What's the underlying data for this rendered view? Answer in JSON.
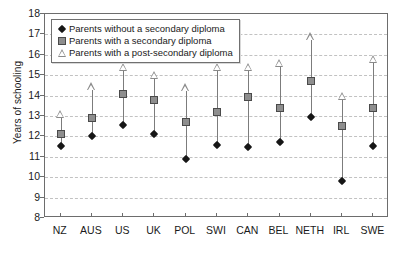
{
  "chart_data": {
    "type": "scatter",
    "title": "",
    "xlabel": "",
    "ylabel": "Years of schooling",
    "ylim": [
      8,
      18
    ],
    "yticks": [
      8,
      9,
      10,
      11,
      12,
      13,
      14,
      15,
      16,
      17,
      18
    ],
    "grid": true,
    "legend_position": "top-left",
    "categories": [
      "NZ",
      "AUS",
      "US",
      "UK",
      "POL",
      "SWI",
      "CAN",
      "BEL",
      "NETH",
      "IRL",
      "SWE"
    ],
    "series": [
      {
        "name": "Parents without a secondary diploma",
        "marker": "diamond",
        "color": "#161616",
        "values": [
          11.55,
          12.0,
          12.55,
          12.1,
          10.9,
          11.6,
          11.5,
          11.75,
          12.95,
          9.8,
          11.55
        ]
      },
      {
        "name": "Parents with a secondary diploma",
        "marker": "square",
        "color": "#8e8e8e",
        "values": [
          12.1,
          12.9,
          14.1,
          13.8,
          12.7,
          13.2,
          13.95,
          13.4,
          14.7,
          12.5,
          13.4
        ]
      },
      {
        "name": "Parents with a post-secondary diploma",
        "marker": "triangle",
        "color": "#8a8a8a",
        "values": [
          13.1,
          14.45,
          15.4,
          15.0,
          14.4,
          15.4,
          15.4,
          15.6,
          16.9,
          14.0,
          15.8
        ]
      }
    ]
  },
  "axes": {
    "y_title": "Years of schooling",
    "y_tick_labels": [
      "18",
      "17",
      "16",
      "15",
      "14",
      "13",
      "12",
      "11",
      "10",
      "9",
      "8"
    ],
    "x_tick_labels": [
      "NZ",
      "AUS",
      "US",
      "UK",
      "POL",
      "SWI",
      "CAN",
      "BEL",
      "NETH",
      "IRL",
      "SWE"
    ]
  },
  "legend": {
    "items": [
      {
        "label": "Parents without a secondary diploma",
        "marker": "diamond-marker"
      },
      {
        "label": "Parents with a secondary diploma",
        "marker": "square-marker"
      },
      {
        "label": "Parents with a post-secondary diploma",
        "marker": "triangle-marker"
      }
    ]
  }
}
